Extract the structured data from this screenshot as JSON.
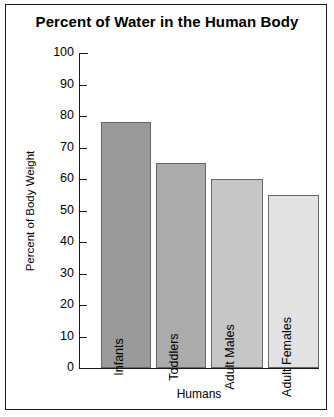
{
  "chart_data": {
    "type": "bar",
    "title": "Percent of Water in the Human Body",
    "xlabel": "Humans",
    "ylabel": "Percent of Body Weight",
    "categories": [
      "Infants",
      "Toddlers",
      "Adult Males",
      "Adult Females"
    ],
    "values": [
      78,
      65,
      60,
      55
    ],
    "ylim": [
      0,
      100
    ],
    "ytick_labels": [
      "100",
      "90",
      "80",
      "70",
      "60",
      "50",
      "40",
      "30",
      "20",
      "10",
      "0"
    ],
    "ytick_values": [
      100,
      90,
      80,
      70,
      60,
      50,
      40,
      30,
      20,
      10,
      0
    ],
    "grid": false,
    "legend": "none",
    "bar_colors": [
      "#9a9a9a",
      "#ababab",
      "#c6c6c6",
      "#e2e2e2"
    ],
    "bar_border_color": "#666666",
    "axis_color": "#1a1a1a",
    "background_color": "#ffffff",
    "bars": [
      {
        "label": "Infants",
        "value": 78,
        "color": "#9a9a9a"
      },
      {
        "label": "Toddlers",
        "value": 65,
        "color": "#ababab"
      },
      {
        "label": "Adult Males",
        "value": 60,
        "color": "#c6c6c6"
      },
      {
        "label": "Adult Females",
        "value": 55,
        "color": "#e2e2e2"
      }
    ]
  }
}
